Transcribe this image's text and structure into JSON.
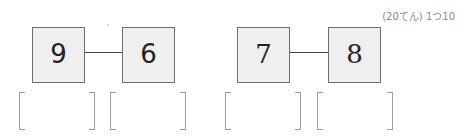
{
  "header": {
    "points_label": "(20てん) 1つ10"
  },
  "problems": [
    {
      "left_number": "9",
      "right_number": "6",
      "answers": [
        "",
        ""
      ]
    },
    {
      "left_number": "7",
      "right_number": "8",
      "answers": [
        "",
        ""
      ]
    }
  ],
  "icons": {
    "connector": "line-connector",
    "answer_bracket": "square-bracket-pair"
  },
  "colors": {
    "box_fill": "#efefef",
    "box_border": "#6e6e6e",
    "bracket": "#9a9a9a",
    "header_text": "#8a8a8a"
  }
}
